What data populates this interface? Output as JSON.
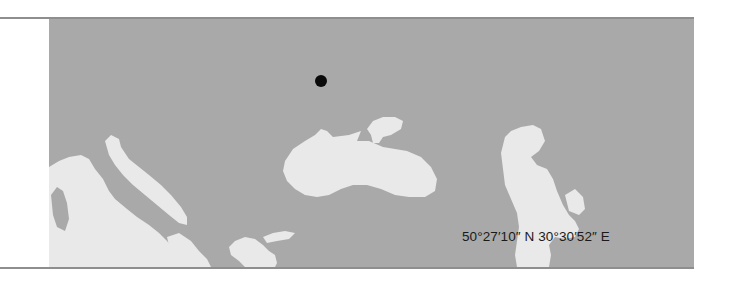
{
  "map": {
    "colors": {
      "land": "#a9a9a9",
      "water": "#e9e9e9",
      "marker": "#0a0a0a",
      "rule": "#8e8e8e",
      "label": "#1a1a1a"
    },
    "marker": {
      "x": 272,
      "y": 62,
      "icon": "location-dot-icon"
    },
    "coordinates_label": "50°27′10″ N 30°30′52″ E",
    "water_bodies": [
      "mediterranean-sea",
      "adriatic-sea",
      "aegean-sea",
      "black-sea",
      "sea-of-azov",
      "caspian-sea"
    ]
  }
}
